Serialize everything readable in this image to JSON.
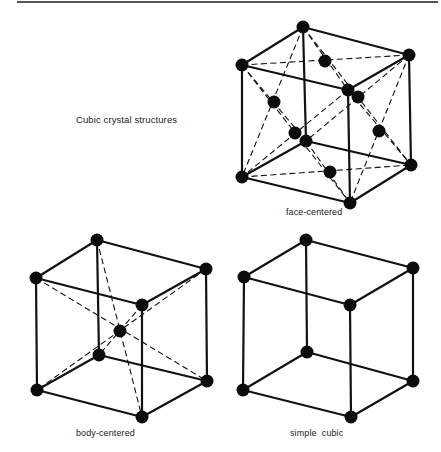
{
  "title": "Cubic crystal structures",
  "colors": {
    "line": "#111111",
    "atom": "#0c0c0c",
    "rule": "#555555",
    "text": "#222222"
  },
  "structures": [
    {
      "name": "face-centered",
      "label": "face-centered",
      "vertices": {
        "tb": [
          303,
          27
        ],
        "tl": [
          242,
          65
        ],
        "tr": [
          409,
          55
        ],
        "tf": [
          348,
          90
        ],
        "bb": [
          306,
          141
        ],
        "bl": [
          242,
          177
        ],
        "br": [
          411,
          165
        ],
        "bf": [
          350,
          203
        ]
      },
      "face_centers": {
        "top": [
          325,
          61
        ],
        "left": [
          274,
          102
        ],
        "front": [
          358,
          97
        ],
        "back": [
          295,
          133
        ],
        "right": [
          379,
          131
        ],
        "bottom": [
          330,
          172
        ]
      }
    },
    {
      "name": "body-centered",
      "label": "body-centered",
      "vertices": {
        "tb": [
          97,
          240
        ],
        "tl": [
          36,
          278
        ],
        "tr": [
          206,
          269
        ],
        "tf": [
          142,
          305
        ],
        "bb": [
          99,
          355
        ],
        "bl": [
          37,
          390
        ],
        "br": [
          207,
          381
        ],
        "bf": [
          142,
          417
        ]
      },
      "center": [
        120,
        331
      ]
    },
    {
      "name": "simple-cubic",
      "label": "simple  cubic",
      "vertices": {
        "tb": [
          306,
          240
        ],
        "tl": [
          244,
          277
        ],
        "tr": [
          413,
          268
        ],
        "tf": [
          350,
          305
        ],
        "bb": [
          307,
          352
        ],
        "bl": [
          243,
          390
        ],
        "br": [
          413,
          381
        ],
        "bf": [
          351,
          417
        ]
      }
    }
  ]
}
